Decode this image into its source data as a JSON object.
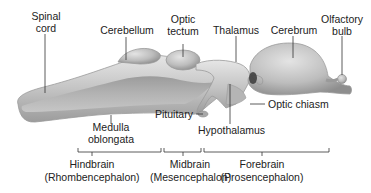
{
  "figure": {
    "colors": {
      "tissue_light": "#dedede",
      "tissue_mid": "#b8b8b8",
      "tissue_dark": "#8e8e8e",
      "ventricle": "#a8a8a8",
      "outline": "#9a9a9a",
      "leader": "#333333"
    },
    "labels": {
      "spinal_cord": [
        "Spinal",
        "cord"
      ],
      "cerebellum": "Cerebellum",
      "optic_tectum": [
        "Optic",
        "tectum"
      ],
      "thalamus": "Thalamus",
      "cerebrum": "Cerebrum",
      "olfactory_bulb": [
        "Olfactory",
        "bulb"
      ],
      "medulla_oblongata": [
        "Medulla",
        "oblongata"
      ],
      "pituitary": "Pituitary",
      "hypothalamus": "Hypothalamus",
      "optic_chiasm": "Optic chiasm"
    },
    "regions": [
      {
        "name": "Hindbrain",
        "latin": "(Rhombencephalon)"
      },
      {
        "name": "Midbrain",
        "latin": "(Mesencephalon)"
      },
      {
        "name": "Forebrain",
        "latin": "(Prosencephalon)"
      }
    ]
  }
}
